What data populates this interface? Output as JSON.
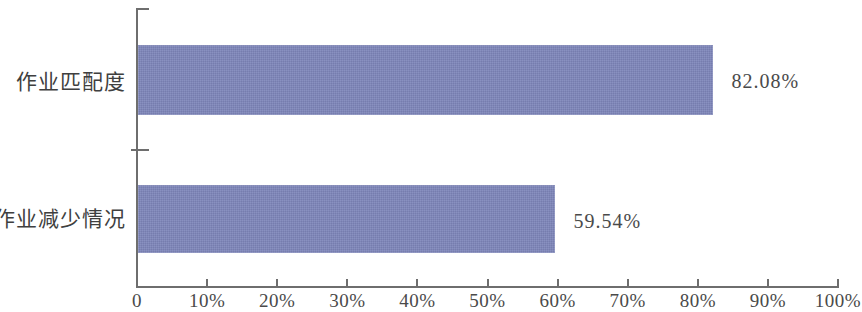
{
  "chart_data": {
    "type": "bar",
    "orientation": "horizontal",
    "title": "",
    "subtitle": "",
    "xlabel": "",
    "ylabel": "",
    "categories": [
      "作业匹配度",
      "作业减少情况"
    ],
    "values": [
      82.08,
      59.54
    ],
    "value_labels": [
      "82.08%",
      "59.54%"
    ],
    "series": [
      {
        "name": "",
        "values": [
          82.08,
          59.54
        ],
        "color": "#7e86ba"
      }
    ],
    "xlim": [
      0,
      100
    ],
    "ylim": null,
    "xticks": [
      0,
      10,
      20,
      30,
      40,
      50,
      60,
      70,
      80,
      90,
      100
    ],
    "xtick_labels": [
      "0",
      "10%",
      "20%",
      "30%",
      "40%",
      "50%",
      "60%",
      "70%",
      "80%",
      "90%",
      "100%"
    ],
    "grid": false,
    "legend": null,
    "legend_position": "none",
    "annotations": [],
    "bar_color": "#7e86ba",
    "axis_color": "#6e6e6e",
    "text_color": "#4a4a4a",
    "background_color": "#ffffff"
  }
}
